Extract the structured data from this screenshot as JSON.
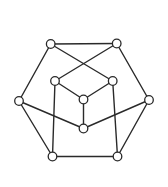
{
  "diagram": {
    "type": "graph",
    "colors": {
      "stroke": "#2a2a2a",
      "node_fill": "#ffffff",
      "background": "#ffffff"
    },
    "node_radius": 4.3,
    "nodes": [
      {
        "id": "TL",
        "x": 50.7,
        "y": 44
      },
      {
        "id": "TR",
        "x": 116.7,
        "y": 43.5
      },
      {
        "id": "IL",
        "x": 55,
        "y": 81
      },
      {
        "id": "IR",
        "x": 112.7,
        "y": 81
      },
      {
        "id": "C",
        "x": 83.5,
        "y": 99.5
      },
      {
        "id": "L",
        "x": 19,
        "y": 101
      },
      {
        "id": "R",
        "x": 149,
        "y": 100
      },
      {
        "id": "LC",
        "x": 83.5,
        "y": 128.5
      },
      {
        "id": "BL",
        "x": 52.5,
        "y": 156.5
      },
      {
        "id": "BR",
        "x": 117.5,
        "y": 156.5
      }
    ],
    "edges": [
      [
        "TL",
        "TR"
      ],
      [
        "TL",
        "L"
      ],
      [
        "TL",
        "IR"
      ],
      [
        "TR",
        "IL"
      ],
      [
        "TR",
        "R"
      ],
      [
        "IL",
        "C"
      ],
      [
        "IR",
        "C"
      ],
      [
        "C",
        "LC"
      ],
      [
        "L",
        "LC"
      ],
      [
        "R",
        "LC"
      ],
      [
        "L",
        "BL"
      ],
      [
        "R",
        "BR"
      ],
      [
        "BL",
        "BR"
      ],
      [
        "IL",
        "BL"
      ],
      [
        "IR",
        "BR"
      ]
    ]
  }
}
